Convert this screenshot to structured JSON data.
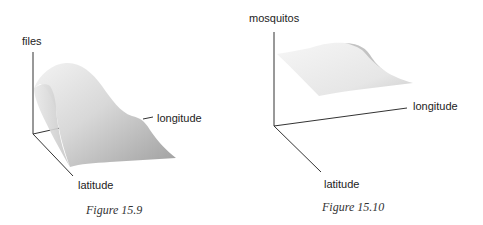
{
  "figures": [
    {
      "caption": "Figure 15.9",
      "axes": {
        "vertical": "files",
        "longitude": "longitude",
        "latitude": "latitude"
      },
      "surface": "peaked surface rising high near origin-side, sloping down toward longitude/latitude"
    },
    {
      "caption": "Figure 15.10",
      "axes": {
        "vertical": "mosquitos",
        "longitude": "longitude",
        "latitude": "latitude"
      },
      "surface": "nearly flat surface with slight wave, elevated above the floor plane"
    }
  ],
  "colors": {
    "axis": "#333333",
    "surface_light": "#f2f2f2",
    "surface_dark": "#a8a8a8"
  }
}
